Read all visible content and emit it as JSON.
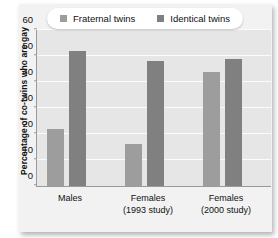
{
  "chart_data": {
    "type": "bar",
    "title": "",
    "xlabel": "",
    "ylabel": "Percentage of co-twins who are gay",
    "ylim": [
      0,
      60
    ],
    "yticks": [
      0,
      10,
      20,
      30,
      40,
      50,
      60
    ],
    "grid": "horizontal",
    "legend_position": "top",
    "categories": [
      {
        "line1": "Males",
        "line2": ""
      },
      {
        "line1": "Females",
        "line2": "(1993 study)"
      },
      {
        "line1": "Females",
        "line2": "(2000 study)"
      }
    ],
    "series": [
      {
        "name": "Fraternal twins",
        "color": "#9d9d9d",
        "values": [
          22,
          16,
          44
        ]
      },
      {
        "name": "Identical twins",
        "color": "#808080",
        "values": [
          52,
          48,
          49
        ]
      }
    ]
  },
  "colors": {
    "plot_background": "#e6e6e6",
    "panel_background": "#f2f2f2",
    "gridline": "#fbfbfb",
    "axis": "#9a9a9a",
    "text": "#111111"
  }
}
